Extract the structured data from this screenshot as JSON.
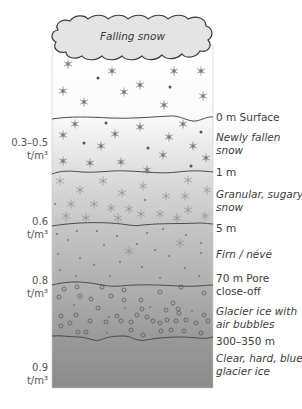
{
  "diagram": {
    "title": "Falling snow",
    "cloud_label": "Falling snow",
    "colors": {
      "top": "#ffffff",
      "surface": "#f4f4f4",
      "granular": "#d6d6d6",
      "firn": "#b8b8b8",
      "bubble_ice": "#a2a2a2",
      "blue_ice": "#8c8c8c",
      "line": "#555555",
      "cloud_fill": "#e4e4e4",
      "cloud_stroke": "#3a3a3a"
    },
    "boundaries": [
      {
        "depth": "0 m Surface",
        "y": 117
      },
      {
        "depth": "1 m",
        "y": 172
      },
      {
        "depth": "5 m",
        "y": 224
      },
      {
        "depth": "70 m Pore close-off",
        "y": 283
      },
      {
        "depth": "300–350 m",
        "y": 336
      }
    ],
    "right_labels": [
      {
        "text": "0 m Surface",
        "style": "normal",
        "y": 111
      },
      {
        "text": "Newly fallen",
        "style": "italic",
        "y": 133
      },
      {
        "text": "snow",
        "style": "italic",
        "y": 146
      },
      {
        "text": "1 m",
        "style": "normal",
        "y": 166
      },
      {
        "text": "Granular, sugary",
        "style": "italic",
        "y": 188
      },
      {
        "text": "snow",
        "style": "italic",
        "y": 201
      },
      {
        "text": "5 m",
        "style": "normal",
        "y": 222
      },
      {
        "text": "Firn / névé",
        "style": "italic",
        "y": 248
      },
      {
        "text": "70 m Pore",
        "style": "normal",
        "y": 273
      },
      {
        "text": "close-off",
        "style": "normal",
        "y": 286
      },
      {
        "text": "Glacier ice with",
        "style": "italic",
        "y": 307
      },
      {
        "text": "air bubbles",
        "style": "italic",
        "y": 320
      },
      {
        "text": "300–350 m",
        "style": "normal",
        "y": 337
      },
      {
        "text": "Clear, hard, blue",
        "style": "italic",
        "y": 354
      },
      {
        "text": "glacier ice",
        "style": "italic",
        "y": 367
      }
    ],
    "density_labels": [
      {
        "value": "0.3–0.5",
        "unit": "t/m³",
        "y": 140
      },
      {
        "value": "0.6",
        "unit": "t/m³",
        "y": 218
      },
      {
        "value": "0.8",
        "unit": "t/m³",
        "y": 276
      },
      {
        "value": "0.9",
        "unit": "t/m³",
        "y": 363
      }
    ]
  }
}
